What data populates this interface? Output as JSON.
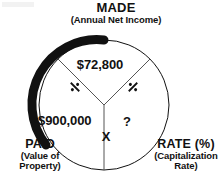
{
  "diagram": {
    "type": "capitalization-rate-circle",
    "background_color": "#ffffff",
    "ink_color": "#111111",
    "segments": [
      {
        "key": "made",
        "position": "top",
        "title": "MADE",
        "subtitle": "(Annual Net Income)",
        "value": "$72,800"
      },
      {
        "key": "paid",
        "position": "bottom-left",
        "title": "PAID",
        "subtitle_line1": "(Value of",
        "subtitle_line2": "Property)",
        "value": "$900,000"
      },
      {
        "key": "rate",
        "position": "bottom-right",
        "title": "RATE (%)",
        "subtitle_line1": "(Capitalization",
        "subtitle_line2": "Rate)",
        "value": "?"
      }
    ],
    "operators": {
      "divide_left": "÷",
      "divide_right": "÷",
      "multiply": "X"
    },
    "emphasis_arc": {
      "description": "thick black arc on upper-left of circle",
      "color": "#111111"
    }
  }
}
